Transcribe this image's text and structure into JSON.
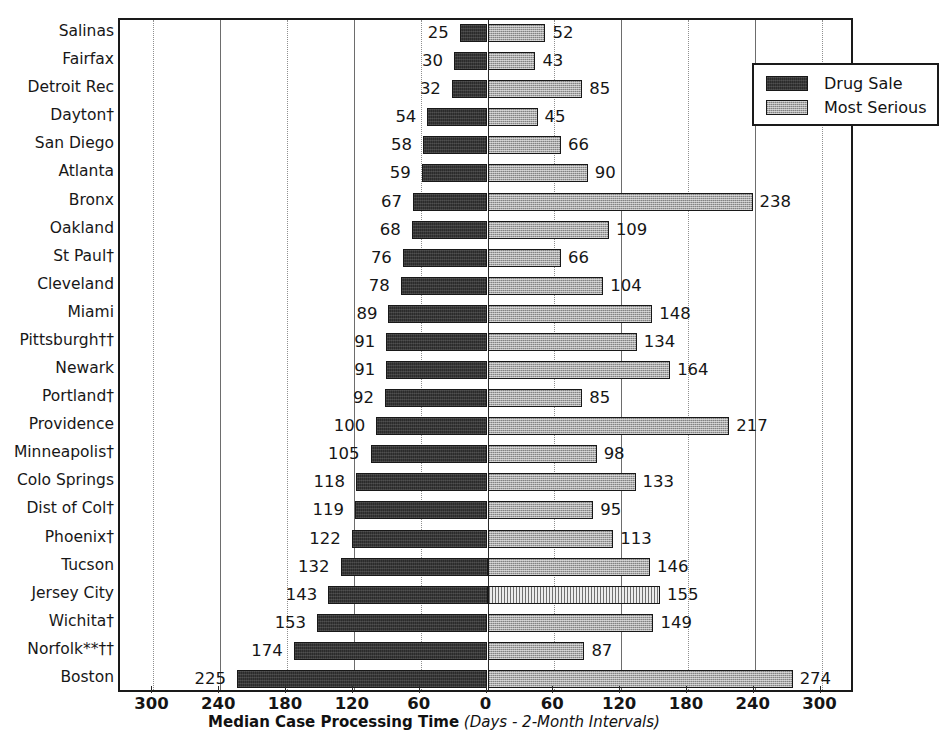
{
  "chart_data": {
    "type": "bar",
    "orientation": "horizontal-diverging",
    "title": "",
    "xlabel": "Median Case Processing Time (Days - 2-Month Intervals)",
    "xlabel_bold_part": "Median Case Processing Time",
    "xlabel_italic_part": "(Days - 2-Month Intervals)",
    "ylabel": "",
    "xlim": [
      -330,
      330
    ],
    "xticks": [
      -300,
      -240,
      -180,
      -120,
      -60,
      0,
      60,
      120,
      180,
      240,
      300
    ],
    "xtick_labels": [
      "300",
      "240",
      "180",
      "120",
      "60",
      "0",
      "60",
      "120",
      "180",
      "240",
      "300"
    ],
    "grid": true,
    "legend_position": "top-right",
    "legend": [
      {
        "name": "Drug Sale",
        "side": "left",
        "color": "#2b2b2b"
      },
      {
        "name": "Most Serious",
        "side": "right",
        "color": "#a9a9a9"
      }
    ],
    "categories": [
      "Salinas",
      "Fairfax",
      "Detroit Rec",
      "Dayton†",
      "San Diego",
      "Atlanta",
      "Bronx",
      "Oakland",
      "St Paul†",
      "Cleveland",
      "Miami",
      "Pittsburgh††",
      "Newark",
      "Portland†",
      "Providence",
      "Minneapolis†",
      "Colo Springs",
      "Dist of Col†",
      "Phoenix†",
      "Tucson",
      "Jersey City",
      "Wichita†",
      "Norfolk**††",
      "Boston"
    ],
    "series": [
      {
        "name": "Drug Sale",
        "values": [
          25,
          30,
          32,
          54,
          58,
          59,
          67,
          68,
          76,
          78,
          89,
          91,
          91,
          92,
          100,
          105,
          118,
          119,
          122,
          132,
          143,
          153,
          174,
          225
        ]
      },
      {
        "name": "Most Serious",
        "values": [
          52,
          43,
          85,
          45,
          66,
          90,
          238,
          109,
          66,
          104,
          148,
          134,
          164,
          85,
          217,
          98,
          133,
          95,
          113,
          146,
          155,
          149,
          87,
          274
        ]
      }
    ]
  }
}
